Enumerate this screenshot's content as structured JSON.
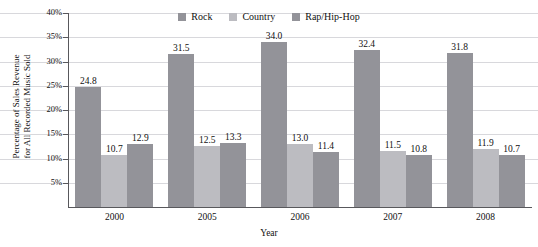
{
  "chart_data": {
    "type": "bar",
    "title": "",
    "categories": [
      "2000",
      "2005",
      "2006",
      "2007",
      "2008"
    ],
    "series": [
      {
        "name": "Rock",
        "color": "#939399",
        "values": [
          24.8,
          31.5,
          34.0,
          32.4,
          31.8
        ]
      },
      {
        "name": "Country",
        "color": "#bcbcc1",
        "values": [
          10.7,
          12.5,
          13.0,
          11.5,
          11.9
        ]
      },
      {
        "name": "Rap/Hip-Hop",
        "color": "#939399",
        "values": [
          12.9,
          13.3,
          11.4,
          10.8,
          10.7
        ]
      }
    ],
    "xlabel": "Year",
    "ylabel": "Percentage of Sales Revenue\nfor All Recorded Music Sold",
    "ylim": [
      0,
      40
    ],
    "yticks": [
      5,
      10,
      15,
      20,
      25,
      30,
      35,
      40
    ],
    "ytick_labels": [
      "5%",
      "10%",
      "15%",
      "20%",
      "25%",
      "30%",
      "35%",
      "40%"
    ],
    "grid": true,
    "legend_position": "top-center",
    "value_label_format": "one-decimal"
  },
  "axes": {
    "y_title_line1": "Percentage of Sales Revenue",
    "y_title_line2": "for All Recorded Music Sold",
    "x_title": "Year"
  },
  "colors": {
    "rock": "#939399",
    "country": "#bcbcc1",
    "rap": "#939399",
    "gridline": "#d8d8dc",
    "axis": "#58585c",
    "text": "#111111",
    "background": "#ffffff"
  }
}
